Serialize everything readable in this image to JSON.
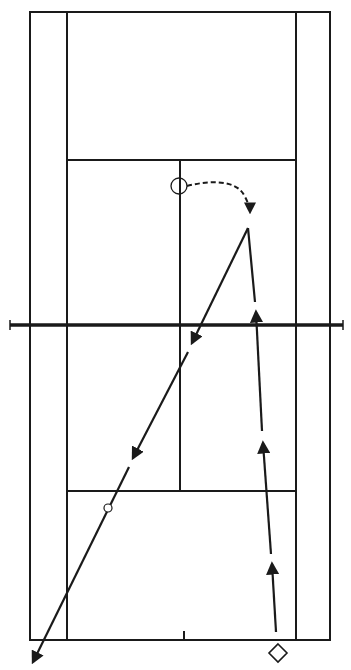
{
  "diagram": {
    "type": "tennis-court-shot-diagram",
    "colors": {
      "background": "#ffffff",
      "line": "#1a1a1a"
    },
    "court": {
      "doubles_left_x": 30,
      "singles_left_x": 67,
      "center_x": 180,
      "singles_right_x": 296,
      "doubles_right_x": 330,
      "top_baseline_y": 12,
      "top_service_line_y": 160,
      "net_y": 325,
      "bottom_service_line_y": 491,
      "bottom_baseline_y": 640,
      "net_left_x": 10,
      "net_right_x": 343
    },
    "markers": {
      "player_circle": {
        "shape": "circle",
        "x": 179,
        "y": 186,
        "r": 8
      },
      "bounce_circle": {
        "shape": "small-circle",
        "x": 108,
        "y": 508,
        "r": 4
      },
      "player_diamond": {
        "shape": "diamond",
        "x": 278,
        "y": 653,
        "size": 9
      }
    },
    "paths": {
      "approach_run": {
        "style": "dashed",
        "description": "player movement from circle to hit point"
      },
      "incoming_ball": {
        "style": "solid-with-arrows",
        "from": [
          276,
          632
        ],
        "to": [
          248,
          228
        ]
      },
      "outgoing_ball": {
        "style": "solid-with-arrows",
        "from": [
          248,
          228
        ],
        "to": [
          33,
          662
        ]
      }
    }
  }
}
